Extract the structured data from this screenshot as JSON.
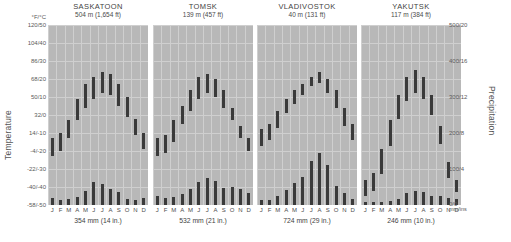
{
  "axes": {
    "temperature_label": "Temperature",
    "precipitation_label": "Precipitation",
    "temp_unit": "°F/°C",
    "precip_unit": "mm/ins",
    "temp_ticks": [
      "120/50",
      "104/40",
      "86/30",
      "68/20",
      "50/10",
      "32/0",
      "14/-10",
      "-4/-20",
      "-22/-30",
      "-40/-40",
      "-58/-50"
    ],
    "precip_ticks": [
      "500/20",
      "400/16",
      "300/12",
      "200/8",
      "100/4",
      "0/0"
    ]
  },
  "months": [
    "J",
    "F",
    "M",
    "A",
    "M",
    "J",
    "J",
    "A",
    "S",
    "O",
    "N",
    "D"
  ],
  "chart_data": {
    "type": "bar",
    "xlabel": "",
    "ylabel": "Temperature",
    "y2label": "Precipitation",
    "ylim": [
      -50,
      50
    ],
    "y2lim": [
      0,
      500
    ],
    "grid": true,
    "categories": [
      "J",
      "F",
      "M",
      "A",
      "M",
      "J",
      "J",
      "A",
      "S",
      "O",
      "N",
      "D"
    ],
    "panels": [
      {
        "name": "SASKATOON",
        "elevation": "504 m (1,654 ft)",
        "annual_precip": "354 mm (14 in.)",
        "temp_min_c": [
          -23,
          -20,
          -13,
          -3,
          4,
          9,
          12,
          11,
          5,
          -1,
          -11,
          -19
        ],
        "temp_max_c": [
          -13,
          -10,
          -3,
          9,
          17,
          21,
          24,
          23,
          17,
          10,
          -2,
          -10
        ],
        "precip_mm": [
          19,
          14,
          18,
          22,
          39,
          63,
          58,
          44,
          36,
          18,
          14,
          19
        ]
      },
      {
        "name": "TOMSK",
        "elevation": "139 m (457 ft)",
        "annual_precip": "532 mm (21 in.)",
        "temp_min_c": [
          -23,
          -21,
          -15,
          -5,
          2,
          9,
          12,
          10,
          4,
          -3,
          -13,
          -20
        ],
        "temp_max_c": [
          -13,
          -11,
          -3,
          5,
          14,
          21,
          23,
          20,
          14,
          4,
          -6,
          -13
        ],
        "precip_mm": [
          24,
          19,
          23,
          30,
          45,
          63,
          74,
          66,
          48,
          50,
          45,
          33
        ]
      },
      {
        "name": "VLADIVOSTOK",
        "elevation": "40 m (131 ft)",
        "annual_precip": "724 mm (29 in.)",
        "temp_min_c": [
          -17,
          -14,
          -7,
          1,
          6,
          11,
          16,
          18,
          12,
          4,
          -6,
          -14
        ],
        "temp_max_c": [
          -8,
          -5,
          2,
          9,
          14,
          17,
          21,
          24,
          20,
          14,
          4,
          -5
        ],
        "precip_mm": [
          13,
          14,
          26,
          43,
          62,
          79,
          121,
          145,
          110,
          53,
          32,
          18
        ]
      },
      {
        "name": "YAKUTSK",
        "elevation": "117 m (384 ft)",
        "annual_precip": "246 mm (10 in.)",
        "temp_min_c": [
          -45,
          -42,
          -33,
          -17,
          -2,
          8,
          12,
          9,
          0,
          -16,
          -35,
          -43
        ],
        "temp_max_c": [
          -36,
          -32,
          -19,
          -3,
          11,
          21,
          25,
          21,
          11,
          -6,
          -26,
          -36
        ],
        "precip_mm": [
          8,
          7,
          7,
          10,
          17,
          34,
          39,
          36,
          26,
          25,
          20,
          17
        ]
      }
    ]
  }
}
